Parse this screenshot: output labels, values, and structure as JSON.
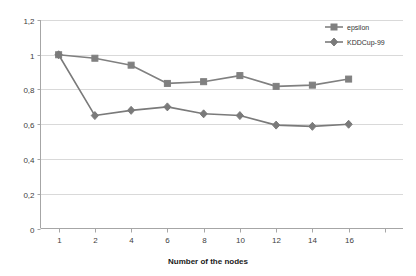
{
  "chart_data": {
    "type": "line",
    "title": "",
    "xlabel": "Number of the nodes",
    "ylabel": "",
    "categories": [
      "1",
      "2",
      "4",
      "6",
      "8",
      "10",
      "12",
      "14",
      "16",
      ""
    ],
    "ytick_labels": [
      "0",
      "0,2",
      "0,4",
      "0,6",
      "0,8",
      "1",
      "1,2"
    ],
    "ytick_values": [
      0,
      0.2,
      0.4,
      0.6,
      0.8,
      1.0,
      1.2
    ],
    "ylim": [
      0,
      1.2
    ],
    "grid": "horizontal",
    "legend_position": "top-right",
    "series": [
      {
        "name": "epsilon",
        "marker": "square",
        "color": "#808080",
        "values": [
          1.0,
          0.98,
          0.94,
          0.835,
          0.845,
          0.88,
          0.818,
          0.825,
          0.86,
          null
        ]
      },
      {
        "name": "KDDCup-99",
        "marker": "diamond",
        "color": "#7a7a7a",
        "values": [
          1.0,
          0.65,
          0.68,
          0.7,
          0.66,
          0.65,
          0.595,
          0.588,
          0.6,
          null
        ]
      }
    ]
  },
  "legend": {
    "items": [
      {
        "label": "epsilon",
        "marker": "square"
      },
      {
        "label": "KDDCup-99",
        "marker": "diamond"
      }
    ]
  },
  "axis": {
    "x_title": "Number of the nodes"
  },
  "colors": {
    "series": "#808080",
    "grid": "#d9d9d9",
    "axis": "#a6a6a6",
    "text": "#404040"
  }
}
